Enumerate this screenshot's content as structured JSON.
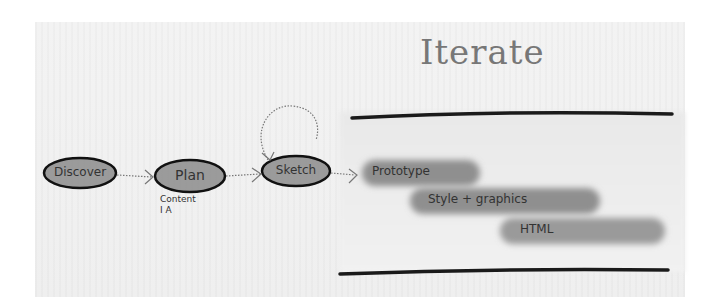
{
  "diagram": {
    "title": "Iterate",
    "flow_nodes": [
      {
        "id": "discover",
        "label": "Discover"
      },
      {
        "id": "plan",
        "label": "Plan",
        "note_lines": [
          "Content",
          "I A"
        ]
      },
      {
        "id": "sketch",
        "label": "Sketch",
        "self_loop": true
      }
    ],
    "iterate_stages": [
      {
        "label": "Prototype"
      },
      {
        "label": "Style + graphics"
      },
      {
        "label": "HTML"
      }
    ],
    "edges": [
      {
        "from": "discover",
        "to": "plan"
      },
      {
        "from": "plan",
        "to": "sketch"
      },
      {
        "from": "sketch",
        "to": "sketch"
      },
      {
        "from": "sketch",
        "to": "prototype"
      }
    ],
    "colors": {
      "ink": "#1a1a1a",
      "node_fill": "#8c8c8c",
      "bar_fill": "#8f8f8f",
      "paper": "#f1f1f1",
      "title_ink": "#777777"
    }
  }
}
